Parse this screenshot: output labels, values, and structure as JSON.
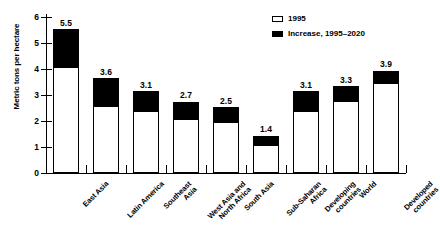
{
  "chart_data": {
    "type": "bar",
    "title": "",
    "subtitle": "",
    "xlabel": "",
    "ylabel": "Metric tons per hectare",
    "ylim": [
      0,
      6
    ],
    "ytick_labels": [
      "0",
      "1",
      "2",
      "3",
      "4",
      "5",
      "6"
    ],
    "grid": false,
    "stacked": true,
    "legend_position": "top-right",
    "categories": [
      "East Asia",
      "Latin America",
      "Southeast\nAsia",
      "West Asia and\nNorth Africa",
      "South Asia",
      "Sub-Saharan\nAfrica",
      "Developing\ncountries",
      "World",
      "Developed\ncountries"
    ],
    "series": [
      {
        "name": "1995",
        "color": "#ffffff",
        "values": [
          4.0,
          2.5,
          2.3,
          2.0,
          1.9,
          1.0,
          2.3,
          2.7,
          3.4
        ]
      },
      {
        "name": "Increase, 1995–2020",
        "color": "#000000",
        "values": [
          1.5,
          1.1,
          0.8,
          0.7,
          0.6,
          0.4,
          0.8,
          0.6,
          0.5
        ]
      }
    ],
    "totals": [
      5.5,
      3.6,
      3.1,
      2.7,
      2.5,
      1.4,
      3.1,
      3.3,
      3.9
    ],
    "total_labels": [
      "5.5",
      "3.6",
      "3.1",
      "2.7",
      "2.5",
      "1.4",
      "3.1",
      "3.3",
      "3.9"
    ]
  },
  "legend": {
    "items": [
      {
        "label": "1995",
        "swatch": "open"
      },
      {
        "label": "Increase, 1995–2020",
        "swatch": "filled"
      }
    ]
  },
  "axis": {
    "y_title": "Metric tons per hectare"
  }
}
